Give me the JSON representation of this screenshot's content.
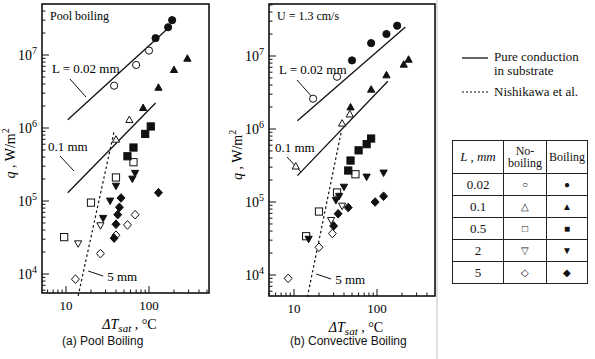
{
  "chart_data": [
    {
      "type": "scatter",
      "title": "(a) Pool Boiling",
      "annotation": "Pool boiling",
      "xlabel": "ΔTsat , °C",
      "ylabel": "q , W/m2",
      "xscale": "log",
      "yscale": "log",
      "xlim": [
        6,
        500
      ],
      "ylim": [
        5000,
        40000000
      ],
      "xticks": [
        "10",
        "100"
      ],
      "yticks": [
        "10^4",
        "10^5",
        "10^6",
        "10^7"
      ],
      "lines": [
        {
          "name": "L = 0.02 mm",
          "style": "solid",
          "points": [
            [
              10.5,
              1300000
            ],
            [
              175,
              24000000
            ]
          ]
        },
        {
          "name": "0.1 mm",
          "style": "solid",
          "points": [
            [
              10.5,
              130000
            ],
            [
              120,
              2200000
            ]
          ]
        },
        {
          "name": "5 mm",
          "style": "dashed",
          "points": [
            [
              14,
              5000
            ],
            [
              38,
              900000
            ]
          ]
        }
      ],
      "series": [
        {
          "name": "0.02 mm no-boiling",
          "marker": "circle-open",
          "points": [
            [
              38,
              3800000
            ],
            [
              70,
              7300000
            ],
            [
              100,
              11500000
            ]
          ]
        },
        {
          "name": "0.02 mm boiling",
          "marker": "circle-filled",
          "points": [
            [
              120,
              17000000
            ],
            [
              170,
              24000000
            ],
            [
              190,
              30000000
            ]
          ]
        },
        {
          "name": "0.1 mm no-boiling",
          "marker": "triangle-open",
          "points": [
            [
              40,
              700000
            ],
            [
              58,
              1300000
            ]
          ]
        },
        {
          "name": "0.1 mm boiling",
          "marker": "triangle-filled",
          "points": [
            [
              85,
              1900000
            ],
            [
              130,
              3600000
            ],
            [
              200,
              6300000
            ],
            [
              290,
              9000000
            ]
          ]
        },
        {
          "name": "0.5 mm no-boiling",
          "marker": "square-open",
          "points": [
            [
              9.5,
              32000
            ],
            [
              20,
              95000
            ],
            [
              40,
              210000
            ],
            [
              65,
              340000
            ]
          ]
        },
        {
          "name": "0.5 mm boiling",
          "marker": "square-filled",
          "points": [
            [
              55,
              410000
            ],
            [
              65,
              540000
            ],
            [
              90,
              830000
            ],
            [
              105,
              1050000
            ]
          ]
        },
        {
          "name": "2 mm no-boiling",
          "marker": "triangle-down-open",
          "points": [
            [
              14,
              26000
            ],
            [
              26,
              46000
            ]
          ]
        },
        {
          "name": "2 mm boiling",
          "marker": "triangle-down-filled",
          "points": [
            [
              28,
              58000
            ],
            [
              34,
              100000
            ],
            [
              40,
              160000
            ],
            [
              63,
              200000
            ],
            [
              68,
              240000
            ]
          ]
        },
        {
          "name": "5 mm no-boiling",
          "marker": "diamond-open",
          "points": [
            [
              13,
              8500
            ],
            [
              26,
              19000
            ],
            [
              40,
              34000
            ],
            [
              55,
              47000
            ],
            [
              68,
              65000
            ]
          ]
        },
        {
          "name": "5 mm boiling",
          "marker": "diamond-filled",
          "points": [
            [
              38,
              31000
            ],
            [
              40,
              48000
            ],
            [
              42,
              65000
            ],
            [
              44,
              82000
            ],
            [
              46,
              110000
            ],
            [
              130,
              130000
            ]
          ]
        }
      ]
    },
    {
      "type": "scatter",
      "title": "(b) Convective Boiling",
      "annotation": "U = 1.3 cm/s",
      "xlabel": "ΔTsat , °C",
      "ylabel": "q , W/m2",
      "xscale": "log",
      "yscale": "log",
      "xlim": [
        6,
        500
      ],
      "ylim": [
        5000,
        40000000
      ],
      "xticks": [
        "10",
        "100"
      ],
      "yticks": [
        "10^4",
        "10^5",
        "10^6",
        "10^7"
      ],
      "lines": [
        {
          "name": "L = 0.02 mm",
          "style": "solid",
          "points": [
            [
              11,
              1300000
            ],
            [
              220,
              25000000
            ]
          ]
        },
        {
          "name": "0.1 mm",
          "style": "solid",
          "points": [
            [
              11,
              230000
            ],
            [
              135,
              4500000
            ]
          ]
        },
        {
          "name": "5 mm",
          "style": "dashed",
          "points": [
            [
              14.5,
              5000
            ],
            [
              37,
              900000
            ]
          ]
        }
      ],
      "series": [
        {
          "name": "0.02 mm no-boiling",
          "marker": "circle-open",
          "points": [
            [
              17,
              2600000
            ],
            [
              33,
              5200000
            ]
          ]
        },
        {
          "name": "0.02 mm boiling",
          "marker": "circle-filled",
          "points": [
            [
              50,
              8700000
            ],
            [
              85,
              15000000
            ],
            [
              130,
              20000000
            ],
            [
              175,
              26000000
            ]
          ]
        },
        {
          "name": "0.1 mm no-boiling",
          "marker": "triangle-open",
          "points": [
            [
              10.5,
              310000
            ],
            [
              38,
              1200000
            ],
            [
              47,
              1600000
            ]
          ]
        },
        {
          "name": "0.1 mm boiling",
          "marker": "triangle-filled",
          "points": [
            [
              48,
              2000000
            ],
            [
              85,
              3500000
            ],
            [
              130,
              5500000
            ],
            [
              210,
              7700000
            ],
            [
              240,
              9000000
            ]
          ]
        },
        {
          "name": "0.5 mm no-boiling",
          "marker": "square-open",
          "points": [
            [
              14,
              34000
            ],
            [
              20,
              74000
            ],
            [
              33,
              135000
            ],
            [
              55,
              240000
            ]
          ]
        },
        {
          "name": "0.5 mm boiling",
          "marker": "square-filled",
          "points": [
            [
              45,
              270000
            ],
            [
              48,
              370000
            ],
            [
              60,
              510000
            ],
            [
              75,
              620000
            ],
            [
              85,
              740000
            ]
          ]
        },
        {
          "name": "2 mm no-boiling",
          "marker": "triangle-down-open",
          "points": [
            [
              28,
              56000
            ],
            [
              38,
              88000
            ]
          ]
        },
        {
          "name": "2 mm boiling",
          "marker": "triangle-down-filled",
          "points": [
            [
              15,
              31000
            ],
            [
              32,
              105000
            ],
            [
              35,
              120000
            ],
            [
              40,
              160000
            ],
            [
              75,
              220000
            ],
            [
              120,
              250000
            ]
          ]
        },
        {
          "name": "5 mm no-boiling",
          "marker": "diamond-open",
          "points": [
            [
              8.5,
              9000
            ],
            [
              20,
              24000
            ],
            [
              29,
              37000
            ]
          ]
        },
        {
          "name": "5 mm boiling",
          "marker": "diamond-filled",
          "points": [
            [
              30,
              47000
            ],
            [
              34,
              69000
            ],
            [
              45,
              84000
            ],
            [
              95,
              100000
            ],
            [
              120,
              120000
            ]
          ]
        }
      ]
    }
  ],
  "panels": {
    "a": {
      "annotation": "Pool boiling",
      "caption": "(a) Pool Boiling",
      "label_top": "L = 0.02 mm",
      "label_mid": "0.1 mm",
      "label_low": "5 mm"
    },
    "b": {
      "annotation": "U = 1.3 cm/s",
      "caption": "(b) Convective Boiling",
      "label_top": "L = 0.02 mm",
      "label_mid": "0.1 mm",
      "label_low": "5 mm"
    }
  },
  "axis": {
    "ylabel_q": "q , W/m",
    "ylabel_sup": "2",
    "xlabel_main": "ΔT",
    "xlabel_sub": "sat",
    "xlabel_unit": " , °C",
    "x10": "10",
    "x100": "100"
  },
  "legend": {
    "solid_label_1": "Pure conduction",
    "solid_label_2": "in substrate",
    "dashed_label": "Nishikawa et al.",
    "table": {
      "headers": [
        "L , mm",
        "No-",
        "boiling",
        "Boiling"
      ],
      "rows": [
        {
          "L": "0.02",
          "no": "○",
          "yes": "●"
        },
        {
          "L": "0.1",
          "no": "△",
          "yes": "▲"
        },
        {
          "L": "0.5",
          "no": "□",
          "yes": "■"
        },
        {
          "L": "2",
          "no": "▽",
          "yes": "▼"
        },
        {
          "L": "5",
          "no": "◇",
          "yes": "◆"
        }
      ]
    }
  }
}
